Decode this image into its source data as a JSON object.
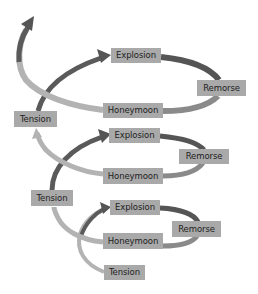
{
  "diagram": {
    "type": "spiral-cycle",
    "colors": {
      "label_bg": "#a9a9a9",
      "label_text": "#1e1e1e",
      "arrow_dark": "#555555",
      "arrow_light": "#b3b3b3"
    },
    "cycles": [
      {
        "position": "top",
        "stages": {
          "tension": "Tension",
          "explosion": "Explosion",
          "remorse": "Remorse",
          "honeymoon": "Honeymoon"
        }
      },
      {
        "position": "middle",
        "stages": {
          "tension": "Tension",
          "explosion": "Explosion",
          "remorse": "Remorse",
          "honeymoon": "Honeymoon"
        }
      },
      {
        "position": "bottom",
        "stages": {
          "tension": "Tension",
          "explosion": "Explosion",
          "remorse": "Remorse",
          "honeymoon": "Honeymoon"
        }
      }
    ]
  }
}
